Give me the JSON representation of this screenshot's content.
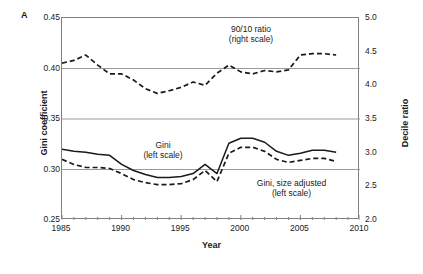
{
  "panel": {
    "label": "A"
  },
  "chart_data": {
    "type": "line",
    "title": "",
    "xlabel": "Year",
    "ylabel": "Gini coefficient",
    "y2label": "Decile ratio",
    "xlim": [
      1985,
      2010
    ],
    "ylim": [
      0.25,
      0.45
    ],
    "y2lim": [
      2.0,
      5.0
    ],
    "xticks": [
      1985,
      1990,
      1995,
      2000,
      2005,
      2010
    ],
    "xtick_labels": [
      "1985",
      "1990",
      "1995",
      "2000",
      "2005",
      "2010"
    ],
    "xminor_step": 1,
    "yticks": [
      0.25,
      0.3,
      0.35,
      0.4,
      0.45
    ],
    "ytick_labels": [
      "0.25",
      "0.30",
      "0.35",
      "0.40",
      "0.45"
    ],
    "y2ticks": [
      2.0,
      2.5,
      3.0,
      3.5,
      4.0,
      4.5,
      5.0
    ],
    "y2tick_labels": [
      "2.0",
      "2.5",
      "3.0",
      "3.5",
      "4.0",
      "4.5",
      "5.0"
    ],
    "gridlines": [
      0.3,
      0.35,
      0.4
    ],
    "grid": true,
    "legend_position": "inline-annotations",
    "annotations": [
      {
        "name": "ratio-annotation",
        "text": "90/10 ratio\n(right scale)"
      },
      {
        "name": "gini-annotation",
        "text": "Gini\n(left scale)"
      },
      {
        "name": "gini-adjusted-annotation",
        "text": "Gini, size adjusted\n(left scale)"
      }
    ],
    "series": [
      {
        "name": "90/10 ratio (right scale)",
        "axis": "right",
        "style": "dashed",
        "color": "#1a1a1a",
        "x": [
          1985,
          1986,
          1987,
          1988,
          1989,
          1990,
          1991,
          1992,
          1993,
          1994,
          1995,
          1996,
          1997,
          1998,
          1999,
          2000,
          2001,
          2002,
          2003,
          2004,
          2005,
          2006,
          2007,
          2008
        ],
        "values": [
          4.33,
          4.37,
          4.45,
          4.3,
          4.17,
          4.17,
          4.08,
          3.95,
          3.88,
          3.92,
          3.97,
          4.05,
          4.0,
          4.18,
          4.3,
          4.2,
          4.17,
          4.22,
          4.2,
          4.23,
          4.45,
          4.47,
          4.47,
          4.45
        ]
      },
      {
        "name": "Gini (left scale)",
        "axis": "left",
        "style": "solid",
        "color": "#1a1a1a",
        "x": [
          1985,
          1986,
          1987,
          1988,
          1989,
          1990,
          1991,
          1992,
          1993,
          1994,
          1995,
          1996,
          1997,
          1998,
          1999,
          2000,
          2001,
          2002,
          2003,
          2004,
          2005,
          2006,
          2007,
          2008
        ],
        "values": [
          0.32,
          0.318,
          0.317,
          0.315,
          0.314,
          0.305,
          0.299,
          0.295,
          0.292,
          0.292,
          0.293,
          0.296,
          0.305,
          0.296,
          0.326,
          0.331,
          0.331,
          0.327,
          0.318,
          0.314,
          0.316,
          0.319,
          0.319,
          0.317
        ]
      },
      {
        "name": "Gini, size adjusted (left scale)",
        "axis": "left",
        "style": "dashed",
        "color": "#1a1a1a",
        "x": [
          1985,
          1986,
          1987,
          1988,
          1989,
          1990,
          1991,
          1992,
          1993,
          1994,
          1995,
          1996,
          1997,
          1998,
          1999,
          2000,
          2001,
          2002,
          2003,
          2004,
          2005,
          2006,
          2007,
          2008
        ],
        "values": [
          0.31,
          0.305,
          0.302,
          0.302,
          0.301,
          0.296,
          0.29,
          0.287,
          0.285,
          0.285,
          0.286,
          0.29,
          0.299,
          0.288,
          0.316,
          0.322,
          0.322,
          0.318,
          0.31,
          0.307,
          0.309,
          0.311,
          0.311,
          0.308
        ]
      }
    ]
  }
}
